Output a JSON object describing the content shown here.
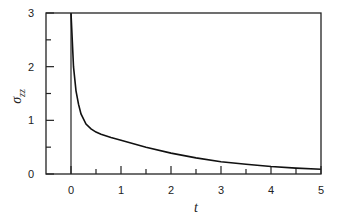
{
  "chart_data": {
    "type": "line",
    "title": "",
    "xlabel": "t",
    "ylabel": "σzz",
    "ylabel_main": "σ",
    "ylabel_sub": "zz",
    "xlim": [
      -0.5,
      5
    ],
    "ylim": [
      0,
      3
    ],
    "grid": false,
    "legend": null,
    "x_ticks": [
      "0",
      "1",
      "2",
      "3",
      "4",
      "5"
    ],
    "y_ticks": [
      "0",
      "1",
      "2",
      "3"
    ],
    "x_minor_step": 0.5,
    "y_minor_step": 0.5,
    "vertical_line_at_t": 0,
    "series": [
      {
        "name": "σzz(t)",
        "x": [
          0.0,
          0.02,
          0.05,
          0.1,
          0.15,
          0.2,
          0.3,
          0.4,
          0.5,
          0.6,
          0.8,
          1.0,
          1.5,
          2.0,
          2.5,
          3.0,
          3.5,
          4.0,
          4.5,
          5.0
        ],
        "values": [
          3.0,
          2.6,
          2.0,
          1.55,
          1.3,
          1.12,
          0.93,
          0.84,
          0.78,
          0.74,
          0.68,
          0.63,
          0.5,
          0.39,
          0.3,
          0.23,
          0.18,
          0.14,
          0.11,
          0.09
        ]
      }
    ]
  }
}
